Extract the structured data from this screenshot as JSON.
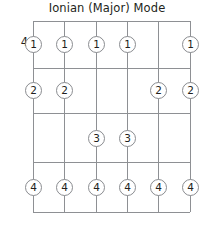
{
  "diagram": {
    "title": "Ionian (Major) Mode",
    "type": "guitar-fretboard-scale-pattern",
    "fret_position_label": "4",
    "geometry": {
      "grid_left": 33,
      "grid_top": 21,
      "grid_width": 157,
      "grid_height": 191,
      "string_x": [
        0,
        31,
        63,
        94,
        125,
        157
      ],
      "fret_y": [
        0,
        47,
        92,
        141,
        191
      ],
      "string_count": 6,
      "fret_line_count": 5,
      "grid_visible": true
    },
    "colors": {
      "grid_line": "#8e9094",
      "dot_outline": "#8a8c90",
      "dot_fill": "#ffffff",
      "text": "#231f20",
      "background": "#ffffff"
    },
    "legend": {
      "notation": "circled numbers indicate fretting finger"
    },
    "rows": [
      {
        "finger": "1",
        "row_index": 0,
        "center_y": 23,
        "strings": [
          1,
          2,
          3,
          4,
          6
        ]
      },
      {
        "finger": "2",
        "row_index": 1,
        "center_y": 69,
        "strings": [
          1,
          2,
          5,
          6
        ]
      },
      {
        "finger": "3",
        "row_index": 2,
        "center_y": 117,
        "strings": [
          3,
          4
        ]
      },
      {
        "finger": "4",
        "row_index": 3,
        "center_y": 166,
        "strings": [
          1,
          2,
          3,
          4,
          5,
          6
        ]
      }
    ],
    "dots": [
      {
        "finger": "1",
        "string": 1,
        "x": 0,
        "y": 23
      },
      {
        "finger": "1",
        "string": 2,
        "x": 31,
        "y": 23
      },
      {
        "finger": "1",
        "string": 3,
        "x": 63,
        "y": 23
      },
      {
        "finger": "1",
        "string": 4,
        "x": 94,
        "y": 23
      },
      {
        "finger": "1",
        "string": 6,
        "x": 157,
        "y": 23
      },
      {
        "finger": "2",
        "string": 1,
        "x": 0,
        "y": 69
      },
      {
        "finger": "2",
        "string": 2,
        "x": 31,
        "y": 69
      },
      {
        "finger": "2",
        "string": 5,
        "x": 125,
        "y": 69
      },
      {
        "finger": "2",
        "string": 6,
        "x": 157,
        "y": 69
      },
      {
        "finger": "3",
        "string": 3,
        "x": 63,
        "y": 117
      },
      {
        "finger": "3",
        "string": 4,
        "x": 94,
        "y": 117
      },
      {
        "finger": "4",
        "string": 1,
        "x": 0,
        "y": 166
      },
      {
        "finger": "4",
        "string": 2,
        "x": 31,
        "y": 166
      },
      {
        "finger": "4",
        "string": 3,
        "x": 63,
        "y": 166
      },
      {
        "finger": "4",
        "string": 4,
        "x": 94,
        "y": 166
      },
      {
        "finger": "4",
        "string": 5,
        "x": 125,
        "y": 166
      },
      {
        "finger": "4",
        "string": 6,
        "x": 157,
        "y": 166
      }
    ]
  }
}
